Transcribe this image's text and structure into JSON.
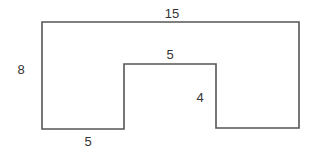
{
  "diagram": {
    "type": "composite-shape",
    "stroke_color": "#555555",
    "background": "#ffffff",
    "labels": {
      "top_width": "15",
      "left_height": "8",
      "notch_width": "5",
      "notch_height": "4",
      "bottom_left_width": "5"
    },
    "dimensions": {
      "outer_width": 15,
      "outer_height": 8,
      "notch_width": 5,
      "notch_depth": 4,
      "bottom_left_segment": 5
    }
  }
}
